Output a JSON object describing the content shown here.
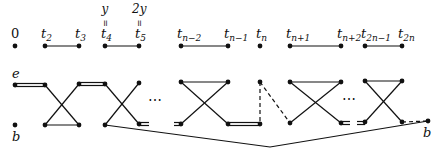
{
  "diagram": {
    "top_row": {
      "nodes": [
        {
          "id": "0",
          "label": "0",
          "x": 15,
          "italic": false
        },
        {
          "id": "t2",
          "label": "t",
          "sub": "2",
          "x": 45
        },
        {
          "id": "t3",
          "label": "t",
          "sub": "3",
          "x": 79
        },
        {
          "id": "t4",
          "label": "t",
          "sub": "4",
          "x": 105,
          "above": "y",
          "eq": "="
        },
        {
          "id": "t5",
          "label": "t",
          "sub": "5",
          "x": 139,
          "above": "2y",
          "eq": "="
        },
        {
          "id": "tn-2",
          "label": "t",
          "sub": "n−2",
          "x": 181
        },
        {
          "id": "tn-1",
          "label": "t",
          "sub": "n−1",
          "x": 228
        },
        {
          "id": "tn",
          "label": "t",
          "sub": "n",
          "x": 260
        },
        {
          "id": "tn+1",
          "label": "t",
          "sub": "n+1",
          "x": 290
        },
        {
          "id": "tn+2",
          "label": "t",
          "sub": "n+2",
          "x": 341
        },
        {
          "id": "t2n-1",
          "label": "t",
          "sub": "2n−1",
          "x": 365
        },
        {
          "id": "t2n",
          "label": "t",
          "sub": "2n",
          "x": 402
        }
      ],
      "edges": [
        [
          "t2",
          "t3"
        ],
        [
          "t4",
          "t5"
        ],
        [
          "tn-2",
          "tn-1"
        ],
        [
          "tn+1",
          "tn+2"
        ],
        [
          "t2n-1",
          "t2n"
        ]
      ]
    },
    "graph": {
      "label_e": "e",
      "label_b_left": "b",
      "label_b_right": "b",
      "ellipsis": "⋯"
    }
  }
}
